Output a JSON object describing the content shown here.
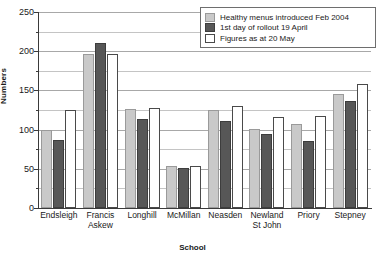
{
  "chart_data": {
    "type": "bar",
    "title": "",
    "xlabel": "School",
    "ylabel": "Numbers",
    "ylim": [
      0,
      250
    ],
    "ytick_step": 50,
    "minor_grid_step": 25,
    "grid": true,
    "legend_position": "top-right",
    "yticks": [
      "0",
      "50",
      "100",
      "150",
      "200",
      "250"
    ],
    "categories": [
      "Endsleigh",
      "Francis\nAskew",
      "Longhill",
      "McMillan",
      "Neasden",
      "Newland\nSt John",
      "Priory",
      "Stepney"
    ],
    "series": [
      {
        "name": "Healthy menus introduced Feb 2004",
        "color": "#c9c9c9",
        "values": [
          100,
          196,
          126,
          54,
          125,
          101,
          107,
          146
        ]
      },
      {
        "name": "1st day of rollout 19 April",
        "color": "#575757",
        "values": [
          87,
          210,
          114,
          51,
          111,
          95,
          86,
          137
        ]
      },
      {
        "name": "Figures as at 20 May",
        "color": "#ffffff",
        "values": [
          125,
          196,
          127,
          53,
          130,
          116,
          117,
          158
        ]
      }
    ]
  },
  "legend": {
    "items": [
      {
        "label": "Healthy menus introduced Feb 2004"
      },
      {
        "label": "1st day of rollout 19 April"
      },
      {
        "label": "Figures as at 20 May"
      }
    ]
  }
}
